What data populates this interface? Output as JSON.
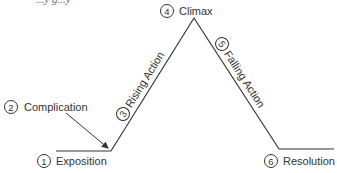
{
  "title_fragment": "...y g...y",
  "stages": [
    {
      "number": "1",
      "label": "Exposition"
    },
    {
      "number": "2",
      "label": "Complication"
    },
    {
      "number": "3",
      "label": "Rising Action"
    },
    {
      "number": "4",
      "label": "Climax"
    },
    {
      "number": "5",
      "label": "Falling Action"
    },
    {
      "number": "6",
      "label": "Resolution"
    }
  ],
  "colors": {
    "line": "#333333",
    "background": "#ffffff"
  }
}
